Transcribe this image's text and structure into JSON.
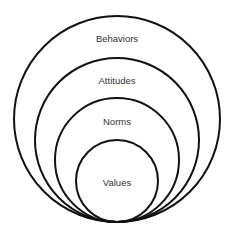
{
  "diagram": {
    "type": "nested-circles",
    "stroke_color": "#111111",
    "background": "#ffffff",
    "layers": [
      {
        "label": "Behaviors",
        "cx": 117,
        "cy": 119,
        "r": 103,
        "label_y": 42
      },
      {
        "label": "Attitudes",
        "cx": 117,
        "cy": 140,
        "r": 82,
        "label_y": 84
      },
      {
        "label": "Norms",
        "cx": 117,
        "cy": 160,
        "r": 62,
        "label_y": 125
      },
      {
        "label": "Values",
        "cx": 117,
        "cy": 181,
        "r": 41,
        "label_y": 186
      }
    ]
  }
}
